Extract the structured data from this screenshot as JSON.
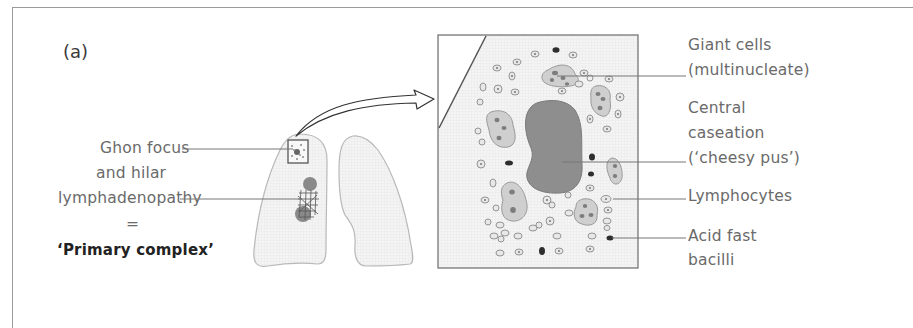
{
  "figure": {
    "panel_label": "(a)",
    "left_labels": {
      "ghon_focus": "Ghon focus",
      "and_hilar": "and hilar",
      "lymphadenopathy": "lymphadenopathy",
      "equals": "=",
      "primary_complex": "‘Primary complex’"
    },
    "right_labels": {
      "giant_cells_line1": "Giant cells",
      "giant_cells_line2": "(multinucleate)",
      "central_line1": "Central",
      "central_line2": "caseation",
      "central_line3": "(‘cheesy pus’)",
      "lymphocytes": "Lymphocytes",
      "afb_line1": "Acid fast",
      "afb_line2": "bacilli"
    },
    "colors": {
      "frame": "#9a9a9a",
      "lung_fill": "#f1f1f1",
      "lung_stroke": "#b5b5b5",
      "caseation": "#8e8e8e",
      "giant_cell_fill": "#cfcfcf",
      "nucleus": "#7d7d7d",
      "bacilli": "#2e2e2e",
      "text": "#6a6a6a"
    }
  }
}
